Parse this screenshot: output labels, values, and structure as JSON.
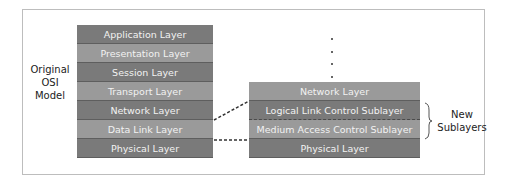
{
  "original_model": {
    "label_lines": [
      "Original",
      "OSI",
      "Model"
    ],
    "layers": [
      {
        "label": "Application Layer",
        "shade": "dark"
      },
      {
        "label": "Presentation Layer",
        "shade": "light"
      },
      {
        "label": "Session Layer",
        "shade": "dark"
      },
      {
        "label": "Transport Layer",
        "shade": "light"
      },
      {
        "label": "Network Layer",
        "shade": "dark"
      },
      {
        "label": "Data Link Layer",
        "shade": "light"
      },
      {
        "label": "Physical Layer",
        "shade": "dark"
      }
    ]
  },
  "new_model": {
    "ellipsis": "⋮",
    "layers": [
      {
        "label": "Network Layer",
        "shade": "light"
      },
      {
        "label": "Logical Link Control Sublayer",
        "shade": "dark"
      },
      {
        "label": "Medium Access Control Sublayer",
        "shade": "light"
      },
      {
        "label": "Physical Layer",
        "shade": "dark"
      }
    ],
    "bracket_label_lines": [
      "New",
      "Sublayers"
    ]
  },
  "colors": {
    "dark_layer": "#7a7a7a",
    "light_layer": "#9a9a9a",
    "layer_text": "#f2f2f2"
  }
}
